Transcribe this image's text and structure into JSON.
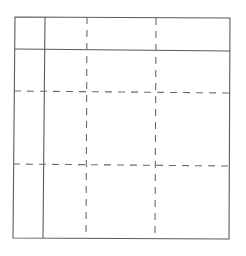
{
  "diagram": {
    "type": "grid-sketch",
    "background": "#ffffff",
    "stroke_color": "#5a5a5a",
    "dashed_color": "#6a6a6a",
    "outer_frame": {
      "corners": {
        "top_left": [
          15,
          17
        ],
        "top_right": [
          230,
          18
        ],
        "bottom_right": [
          229,
          239
        ],
        "bottom_left": [
          13,
          238
        ]
      }
    },
    "solid_lines": [
      {
        "name": "header-row-divider",
        "orientation": "horizontal",
        "from": [
          15,
          49
        ],
        "to": [
          230,
          51
        ]
      },
      {
        "name": "first-column-divider",
        "orientation": "vertical",
        "from": [
          45,
          17
        ],
        "to": [
          43,
          238
        ]
      }
    ],
    "dashed_lines": [
      {
        "name": "dashed-vertical-1",
        "orientation": "vertical",
        "from": [
          87,
          17
        ],
        "to": [
          86,
          238
        ]
      },
      {
        "name": "dashed-vertical-2",
        "orientation": "vertical",
        "from": [
          156,
          18
        ],
        "to": [
          155,
          239
        ]
      },
      {
        "name": "dashed-horizontal-1",
        "orientation": "horizontal",
        "from": [
          14,
          91
        ],
        "to": [
          230,
          93
        ]
      },
      {
        "name": "dashed-horizontal-2",
        "orientation": "horizontal",
        "from": [
          13,
          164
        ],
        "to": [
          229,
          166
        ]
      }
    ],
    "dash_pattern": "7 6"
  }
}
